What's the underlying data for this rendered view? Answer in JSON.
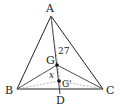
{
  "diagram": {
    "type": "triangle-centroid",
    "points": {
      "A": {
        "label": "A",
        "x": 51,
        "y": 16
      },
      "B": {
        "label": "B",
        "x": 17,
        "y": 89
      },
      "C": {
        "label": "C",
        "x": 103,
        "y": 89
      },
      "D": {
        "label": "D",
        "x": 60,
        "y": 89
      },
      "G": {
        "label": "G",
        "x": 57,
        "y": 65
      },
      "Gp": {
        "label": "G'",
        "x": 59,
        "y": 81
      }
    },
    "annotations": {
      "length_AG": "27",
      "unknown_GGp": "x"
    },
    "colors": {
      "stroke": "#222222",
      "dashed": "#999999"
    }
  }
}
